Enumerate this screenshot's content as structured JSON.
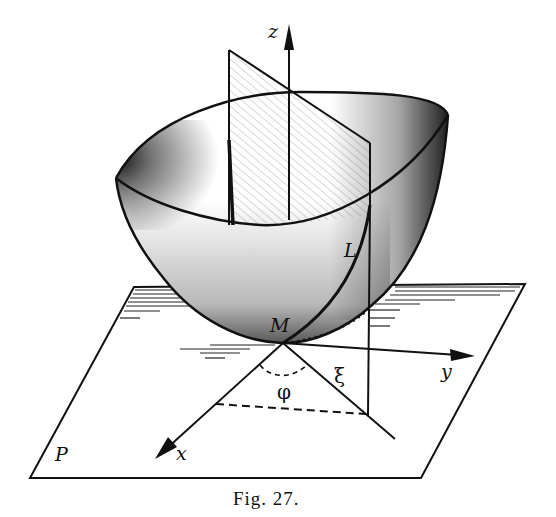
{
  "figure": {
    "caption_prefix": "Fig.",
    "caption_number": "27."
  },
  "labels": {
    "z_axis": "z",
    "y_axis": "y",
    "x_axis": "x",
    "point_M": "M",
    "curve_L": "L",
    "plane_P": "P",
    "angle_phi": "φ",
    "coord_xi": "ξ"
  },
  "colors": {
    "ink": "#111111",
    "background": "#ffffff"
  }
}
